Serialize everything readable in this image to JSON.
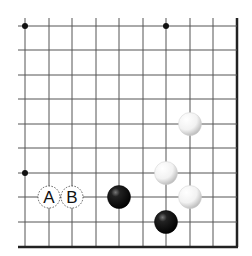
{
  "board": {
    "description": "Go board corner diagram (lower-right corner)",
    "columns_x": [
      25,
      49,
      72,
      96,
      119,
      143,
      166,
      190,
      213,
      237
    ],
    "rows_y": [
      26,
      50,
      75,
      99,
      124,
      148,
      173,
      197,
      222,
      247
    ],
    "left_extent": 18,
    "top_extent": 18,
    "edges": [
      "right",
      "bottom"
    ],
    "line_color": "#555555",
    "edge_color": "#222222",
    "star_points": [
      {
        "col": 0,
        "row": 0
      },
      {
        "col": 6,
        "row": 0
      },
      {
        "col": 0,
        "row": 6
      }
    ]
  },
  "stones": [
    {
      "color": "white",
      "col": 7,
      "row": 4
    },
    {
      "color": "white",
      "col": 6,
      "row": 6
    },
    {
      "color": "white",
      "col": 7,
      "row": 7
    },
    {
      "color": "black",
      "col": 4,
      "row": 7
    },
    {
      "color": "black",
      "col": 6,
      "row": 8
    }
  ],
  "markers": [
    {
      "label": "A",
      "col": 1,
      "row": 7
    },
    {
      "label": "B",
      "col": 2,
      "row": 7
    }
  ]
}
